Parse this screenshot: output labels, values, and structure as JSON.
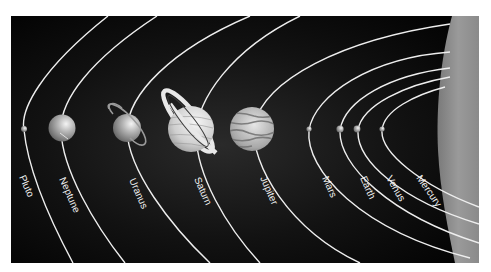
{
  "diagram": {
    "colors": {
      "space": "#050505",
      "orbit": "#eeeeee",
      "sun": "#8c8c8c",
      "label": "#f2f2f2",
      "background": "#ffffff"
    },
    "sun": {
      "name": "Sun",
      "visible": "edge band on right side"
    },
    "planets": [
      {
        "name": "Pluto",
        "label": "Pluto"
      },
      {
        "name": "Neptune",
        "label": "Neptune"
      },
      {
        "name": "Uranus",
        "label": "Uranus"
      },
      {
        "name": "Saturn",
        "label": "Saturn"
      },
      {
        "name": "Jupiter",
        "label": "Jupiter"
      },
      {
        "name": "Mars",
        "label": "Mars"
      },
      {
        "name": "Earth",
        "label": "Earth"
      },
      {
        "name": "Venus",
        "label": "Venus"
      },
      {
        "name": "Mercury",
        "label": "Mercury"
      }
    ]
  }
}
